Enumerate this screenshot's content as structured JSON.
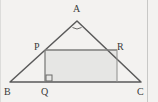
{
  "figure": {
    "width": 158,
    "height": 102,
    "background_color": "#f3f2f0",
    "line_color": "#5a5a5a",
    "fill_color": "#e6e6e4",
    "label_color": "#3a3a3a",
    "frame_color": "#c8c8c6"
  },
  "labels": {
    "apex": "A",
    "rect_top_left": "P",
    "rect_top_right": "R",
    "base_left": "B",
    "base_foot": "Q",
    "base_right": "C"
  },
  "points": {
    "A": {
      "x": 77,
      "y": 21
    },
    "B": {
      "x": 10,
      "y": 82
    },
    "C": {
      "x": 141,
      "y": 82
    },
    "P": {
      "x": 45,
      "y": 50
    },
    "R": {
      "x": 117,
      "y": 50
    },
    "Q": {
      "x": 45,
      "y": 82
    },
    "S": {
      "x": 117,
      "y": 82
    }
  },
  "markers": {
    "apex_angle_marker": "angle-arc-marker",
    "right_angle_marker": "right-angle-square",
    "right_angle_vertex": "Q"
  },
  "segments": [
    {
      "name": "side-AB",
      "from": "A",
      "to": "B"
    },
    {
      "name": "side-AC",
      "from": "A",
      "to": "C"
    },
    {
      "name": "base-BC",
      "from": "B",
      "to": "C"
    },
    {
      "name": "rect-top-PR",
      "from": "P",
      "to": "R"
    },
    {
      "name": "rect-left-PQ",
      "from": "P",
      "to": "Q"
    },
    {
      "name": "rect-right-RS",
      "from": "R",
      "to": "S"
    }
  ]
}
